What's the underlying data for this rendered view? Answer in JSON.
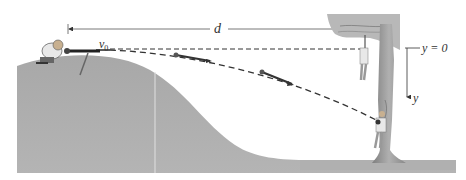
{
  "diagram": {
    "type": "projectile-motion-illustration",
    "labels": {
      "distance": "d",
      "initial_velocity": "v",
      "initial_velocity_sub": "0",
      "y_origin": "y = 0",
      "y_axis": "y"
    },
    "elements": [
      "hill",
      "hunter-with-dart-gun",
      "horizontal-reference-line",
      "dart-trajectory",
      "dart-in-flight-1",
      "dart-in-flight-2",
      "monkey-hanging",
      "monkey-falling",
      "tree",
      "y-axis-arrow",
      "distance-dimension-line"
    ],
    "colors": {
      "hill": "#a6a6a6",
      "trajectory": "#333333",
      "dimension_line": "#555555",
      "tree": "#9a9a9a",
      "foliage": "#b8b8b8",
      "ground": "#b0b0b0"
    }
  }
}
